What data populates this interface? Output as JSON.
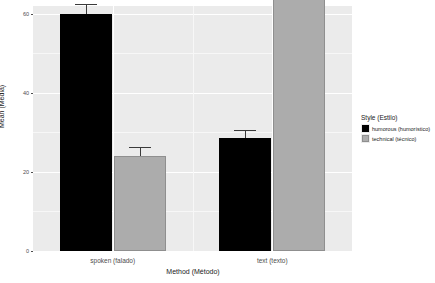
{
  "chart_data": {
    "type": "bar",
    "title": "",
    "xlabel": "Method (Método)",
    "ylabel": "Mean (Média)",
    "categories": [
      "spoken (falado)",
      "text (texto)"
    ],
    "series": [
      {
        "name": "humorous (humorístico)",
        "color": "#000000",
        "values": [
          60,
          28.5
        ],
        "errors": [
          2.4,
          2.2
        ]
      },
      {
        "name": "technical (técnico)",
        "color": "#acacac",
        "values": [
          24,
          68.5
        ],
        "errors": [
          2.2,
          2.4
        ]
      }
    ],
    "ylim": [
      0,
      62
    ],
    "yticks": [
      0,
      20,
      40,
      60
    ],
    "ytick_labels": [
      "0",
      "20",
      "40",
      "60"
    ],
    "grid": true,
    "legend": {
      "title": "Style (Estilo)",
      "position": "right",
      "entries": [
        "humorous (humorístico)",
        "technical (técnico)"
      ]
    },
    "panel_background": "#ebebeb",
    "gridline_color": "#ffffff",
    "axis_text_color": "#4d4d4d"
  }
}
